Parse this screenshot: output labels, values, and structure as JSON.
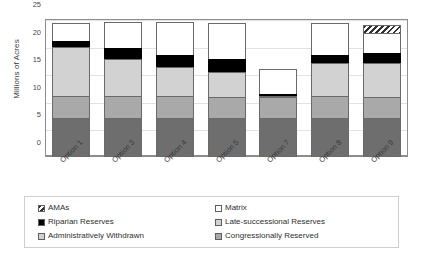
{
  "chart_data": {
    "type": "bar",
    "stacked": true,
    "title": "",
    "xlabel": "",
    "ylabel": "Millions of Acres",
    "ylim": [
      0,
      25
    ],
    "yticks": [
      0,
      5,
      10,
      15,
      20,
      25
    ],
    "grid": true,
    "legend_position": "bottom",
    "categories": [
      "Option 1",
      "Option 3",
      "Option 4",
      "Option 5",
      "Option 7",
      "Option 8",
      "Option 9"
    ],
    "series": [
      {
        "name": "Congressionally Reserved",
        "color": "#6e6e6e",
        "pattern": "solid",
        "values": [
          7.0,
          7.0,
          7.0,
          7.0,
          7.0,
          7.0,
          7.0
        ]
      },
      {
        "name": "Administratively Withdrawn",
        "color": "#a9a9a9",
        "pattern": "solid",
        "values": [
          4.0,
          4.0,
          4.0,
          3.9,
          3.9,
          4.0,
          3.9
        ]
      },
      {
        "name": "Late-successional Reserves",
        "color": "#d2d2d2",
        "pattern": "solid",
        "values": [
          9.0,
          6.7,
          5.3,
          4.5,
          0.2,
          6.0,
          6.1
        ]
      },
      {
        "name": "Riparian Reserves",
        "color": "#000000",
        "pattern": "solid",
        "values": [
          1.0,
          2.0,
          2.1,
          2.4,
          0.4,
          1.4,
          1.9
        ]
      },
      {
        "name": "Matrix",
        "color": "#ffffff",
        "pattern": "solid",
        "values": [
          3.3,
          4.7,
          6.0,
          6.5,
          4.5,
          5.9,
          3.5
        ]
      },
      {
        "name": "AMAs",
        "color": "#ffffff",
        "pattern": "hatched",
        "values": [
          0.0,
          0.0,
          0.0,
          0.0,
          0.0,
          0.0,
          1.5
        ]
      }
    ],
    "totals": [
      24.3,
      24.4,
      24.4,
      24.3,
      16.0,
      24.3,
      23.9
    ]
  },
  "legend": {
    "items": [
      {
        "label": "AMAs",
        "swatch": "hatched"
      },
      {
        "label": "Matrix",
        "swatch": "white"
      },
      {
        "label": "Riparian Reserves",
        "swatch": "black"
      },
      {
        "label": "Late-successional Reserves",
        "swatch": "light-gray"
      },
      {
        "label": "Administratively Withdrawn",
        "swatch": "light-gray"
      },
      {
        "label": "Congressionally Reserved",
        "swatch": "dark-gray"
      }
    ]
  }
}
